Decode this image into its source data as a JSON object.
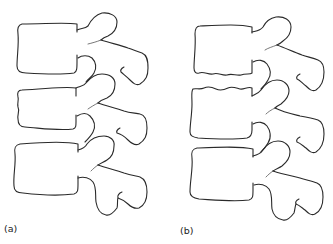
{
  "figure": {
    "panels": [
      {
        "id": "a",
        "label": "(a)",
        "description": "Lateral view of three lumbar vertebrae with flat, normal endplates",
        "vertebrae_count": 3
      },
      {
        "id": "b",
        "label": "(b)",
        "description": "Lateral view of three lumbar vertebrae with wavy, irregular endplates",
        "vertebrae_count": 3
      }
    ],
    "colors": {
      "line": "#2a2a2a",
      "background": "#ffffff"
    }
  }
}
